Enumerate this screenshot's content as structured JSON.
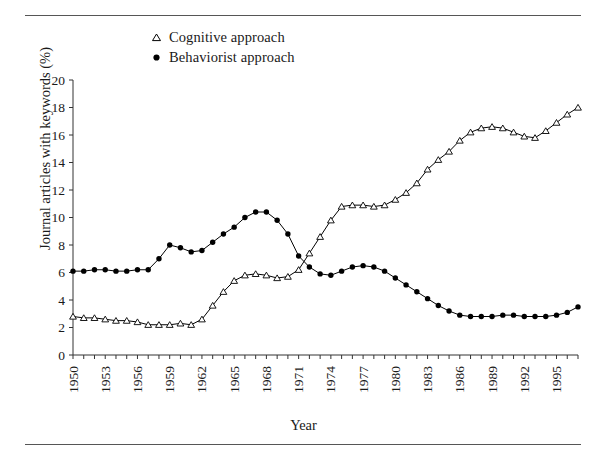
{
  "figure": {
    "xlabel": "Year",
    "ylabel": "Journal articles with keywords (%)"
  },
  "legend": {
    "items": [
      {
        "label": "Cognitive approach",
        "marker": "open-triangle",
        "color": "#000000"
      },
      {
        "label": "Behaviorist approach",
        "marker": "filled-circle",
        "color": "#000000"
      }
    ]
  },
  "chart_data": {
    "type": "line",
    "title": "",
    "xlabel": "Year",
    "ylabel": "Journal articles with keywords (%)",
    "xlim": [
      1950,
      1997
    ],
    "ylim": [
      0,
      20
    ],
    "ytick_step": 2,
    "xtick_step": 1,
    "xtick_label_step": 3,
    "grid": false,
    "legend_position": "top-left",
    "yticks": [
      0,
      2,
      4,
      6,
      8,
      10,
      12,
      14,
      16,
      18,
      20
    ],
    "xticks": [
      1950,
      1951,
      1952,
      1953,
      1954,
      1955,
      1956,
      1957,
      1958,
      1959,
      1960,
      1961,
      1962,
      1963,
      1964,
      1965,
      1966,
      1967,
      1968,
      1969,
      1970,
      1971,
      1972,
      1973,
      1974,
      1975,
      1976,
      1977,
      1978,
      1979,
      1980,
      1981,
      1982,
      1983,
      1984,
      1985,
      1986,
      1987,
      1988,
      1989,
      1990,
      1991,
      1992,
      1993,
      1994,
      1995,
      1996,
      1997
    ],
    "xtick_labels": [
      "1950",
      "",
      "",
      "1953",
      "",
      "",
      "1956",
      "",
      "",
      "1959",
      "",
      "",
      "1962",
      "",
      "",
      "1965",
      "",
      "",
      "1968",
      "",
      "",
      "1971",
      "",
      "",
      "1974",
      "",
      "",
      "1977",
      "",
      "",
      "1980",
      "",
      "",
      "1983",
      "",
      "",
      "1986",
      "",
      "",
      "1989",
      "",
      "",
      "1992",
      "",
      "",
      "1995",
      "",
      ""
    ],
    "x": [
      1950,
      1951,
      1952,
      1953,
      1954,
      1955,
      1956,
      1957,
      1958,
      1959,
      1960,
      1961,
      1962,
      1963,
      1964,
      1965,
      1966,
      1967,
      1968,
      1969,
      1970,
      1971,
      1972,
      1973,
      1974,
      1975,
      1976,
      1977,
      1978,
      1979,
      1980,
      1981,
      1982,
      1983,
      1984,
      1985,
      1986,
      1987,
      1988,
      1989,
      1990,
      1991,
      1992,
      1993,
      1994,
      1995,
      1996,
      1997
    ],
    "series": [
      {
        "name": "Cognitive approach",
        "marker": "open-triangle",
        "color": "#000000",
        "values": [
          2.8,
          2.7,
          2.7,
          2.6,
          2.5,
          2.5,
          2.4,
          2.2,
          2.2,
          2.2,
          2.3,
          2.2,
          2.6,
          3.6,
          4.6,
          5.4,
          5.8,
          5.9,
          5.8,
          5.6,
          5.7,
          6.2,
          7.4,
          8.6,
          9.8,
          10.8,
          10.9,
          10.9,
          10.8,
          10.9,
          11.3,
          11.8,
          12.5,
          13.5,
          14.2,
          14.8,
          15.6,
          16.2,
          16.5,
          16.6,
          16.5,
          16.2,
          15.9,
          15.8,
          16.3,
          16.9,
          17.5,
          18.0
        ]
      },
      {
        "name": "Behaviorist approach",
        "marker": "filled-circle",
        "color": "#000000",
        "values": [
          6.1,
          6.1,
          6.2,
          6.2,
          6.1,
          6.1,
          6.2,
          6.2,
          7.0,
          8.0,
          7.8,
          7.5,
          7.6,
          8.2,
          8.8,
          9.3,
          10.0,
          10.4,
          10.4,
          9.8,
          8.8,
          7.2,
          6.4,
          5.9,
          5.8,
          6.1,
          6.4,
          6.5,
          6.4,
          6.1,
          5.6,
          5.1,
          4.6,
          4.1,
          3.6,
          3.2,
          2.9,
          2.8,
          2.8,
          2.8,
          2.9,
          2.9,
          2.8,
          2.8,
          2.8,
          2.9,
          3.1,
          3.5
        ]
      }
    ]
  }
}
